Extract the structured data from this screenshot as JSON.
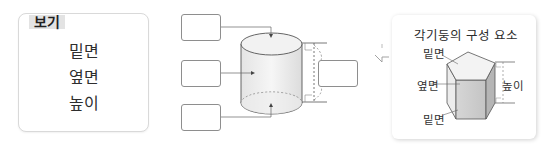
{
  "bogi": {
    "label": "보기",
    "words": [
      "밑면",
      "옆면",
      "높이"
    ]
  },
  "cylinder_diagram": {
    "answer_boxes": [
      {
        "id": "top-base",
        "value": ""
      },
      {
        "id": "side-face",
        "value": ""
      },
      {
        "id": "bottom-base",
        "value": ""
      },
      {
        "id": "height",
        "value": ""
      }
    ]
  },
  "concept": {
    "title": "각기둥의 구성 요소",
    "labels": {
      "top_base": "밑면",
      "side_face": "옆면",
      "bottom_base": "밑면",
      "height": "높이"
    }
  },
  "colors": {
    "box_border": "#8e8e8e",
    "label_bg": "#e3e3e3",
    "line": "#555555"
  }
}
